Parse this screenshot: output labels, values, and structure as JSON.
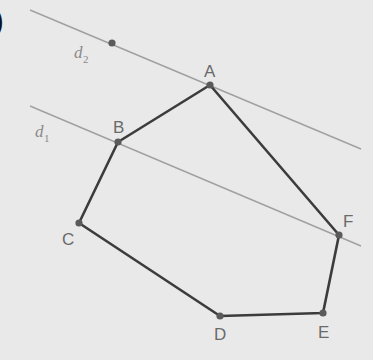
{
  "diagram": {
    "background": "#e9e9e9",
    "polygon_color": "#3c3c3c",
    "parallel_line_color": "#a0a0a0",
    "point_color": "#5a5a5a",
    "label_color": "#6a6a6a",
    "corner_glyph": ")",
    "vertices": [
      {
        "name": "A",
        "x": 210,
        "y": 85
      },
      {
        "name": "B",
        "x": 118,
        "y": 142
      },
      {
        "name": "C",
        "x": 79,
        "y": 223
      },
      {
        "name": "D",
        "x": 220,
        "y": 316
      },
      {
        "name": "E",
        "x": 323,
        "y": 313
      },
      {
        "name": "F",
        "x": 339,
        "y": 235
      }
    ],
    "lines": [
      {
        "name": "d2",
        "label": "d",
        "subscript": "2",
        "x1": 30,
        "y1": 10,
        "x2": 361,
        "y2": 149,
        "extra_point": {
          "x": 112,
          "y": 43
        }
      },
      {
        "name": "d1",
        "label": "d",
        "subscript": "1",
        "x1": 30,
        "y1": 106,
        "x2": 361,
        "y2": 246
      }
    ],
    "labels": {
      "A": "A",
      "B": "B",
      "C": "C",
      "D": "D",
      "E": "E",
      "F": "F",
      "d2_main": "d",
      "d2_sub": "2",
      "d1_main": "d",
      "d1_sub": "1"
    }
  }
}
